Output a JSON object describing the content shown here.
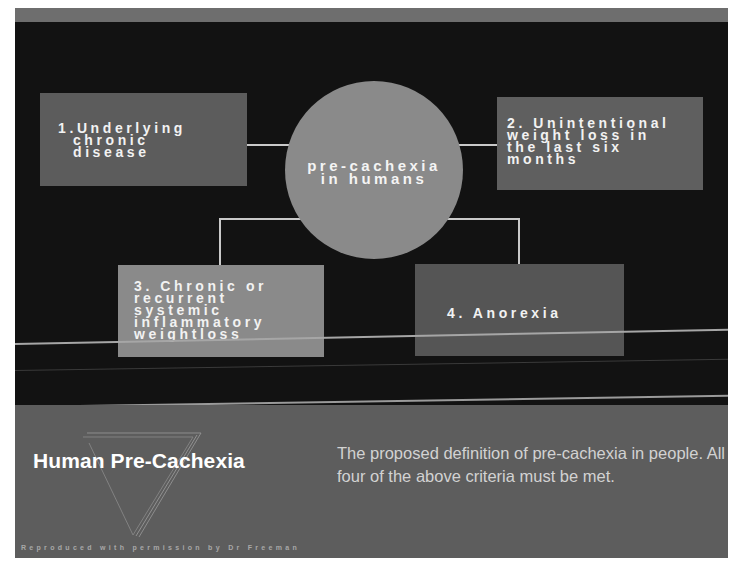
{
  "diagram": {
    "center": {
      "label_line1": "pre-cachexia",
      "label_line2": "in humans"
    },
    "criteria": [
      {
        "number": "1.",
        "text": "1.Underlying\n  chronic\n  disease"
      },
      {
        "number": "2.",
        "text": "2. Unintentional\nweight loss in\nthe last six\nmonths"
      },
      {
        "number": "3.",
        "text": "3. Chronic or\nrecurrent\nsystemic\ninflammatory\nweightloss"
      },
      {
        "number": "4.",
        "text": "4. Anorexia"
      }
    ]
  },
  "caption": {
    "title": "Human Pre-Cachexia",
    "description": "The proposed definition of pre-cachexia in people. All four of the above criteria must be met.",
    "credit": "Reproduced with permission by Dr Freeman"
  },
  "colors": {
    "background_dark": "#121212",
    "box_gray_dark": "#5c5c5c",
    "box_gray_light": "#8a8a8a",
    "circle": "#8a8a8a",
    "connector": "#c9c9c9",
    "panel": "#5d5d5d"
  }
}
